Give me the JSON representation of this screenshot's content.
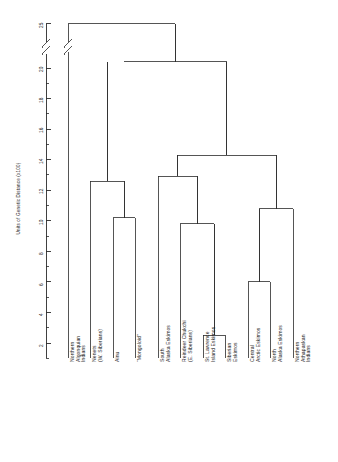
{
  "figure": {
    "title": "",
    "ylabel": "Units of Genetic Distance (x100)"
  },
  "axis": {
    "ticks": [
      {
        "value": 25,
        "label": "25"
      },
      {
        "value": 20,
        "label": "20"
      },
      {
        "value": 18,
        "label": "18"
      },
      {
        "value": 16,
        "label": "16"
      },
      {
        "value": 14,
        "label": "14"
      },
      {
        "value": 12,
        "label": "12"
      },
      {
        "value": 10,
        "label": "10"
      },
      {
        "value": 8,
        "label": "8"
      },
      {
        "value": 6,
        "label": "6"
      },
      {
        "value": 4,
        "label": "4"
      },
      {
        "value": 2,
        "label": "2"
      }
    ],
    "minor_ticks": [
      19,
      17,
      15,
      13,
      11,
      9,
      7,
      5,
      3,
      1
    ],
    "break_marker": true
  },
  "chart_data": {
    "type": "dendrogram",
    "title": "",
    "xlabel": "",
    "ylabel": "Units of Genetic Distance (x100)",
    "ylim": [
      0,
      25
    ],
    "grid": false,
    "legend": "none",
    "orientation": "top-down",
    "axis_break": {
      "from": 20.6,
      "to": 24.2
    },
    "leaves": [
      {
        "id": "northern-algonquian-indians",
        "line1": "Northern",
        "line2": "Algonquian",
        "line3": "Indians",
        "x": 68
      },
      {
        "id": "nenets-w-siberians",
        "line1": "Nenets",
        "line2": "(W. Siberians)",
        "line3": "",
        "x": 90
      },
      {
        "id": "ainu",
        "line1": "Ainu",
        "line2": "",
        "line3": "",
        "x": 113
      },
      {
        "id": "mongoloid",
        "line1": "“Mongoloid”",
        "line2": "",
        "line3": "",
        "x": 135
      },
      {
        "id": "south-alaska-eskimos",
        "line1": "South",
        "line2": "Alaska Eskimos",
        "line3": "",
        "x": 158
      },
      {
        "id": "reindeer-chukchi-e-siberians",
        "line1": "Reindeer Chukchi",
        "line2": "(E. Siberians)",
        "line3": "",
        "x": 180
      },
      {
        "id": "st-lawrence-island-eskimos",
        "line1": "St. Lawrence",
        "line2": "Island Eskimos",
        "line3": "",
        "x": 203
      },
      {
        "id": "siberian-eskimos",
        "line1": "Siberian",
        "line2": "Eskimos",
        "line3": "",
        "x": 225
      },
      {
        "id": "central-arctic-eskimos",
        "line1": "Central",
        "line2": "Arctic Eskimos",
        "line3": "",
        "x": 248
      },
      {
        "id": "north-alaska-eskimos",
        "line1": "North",
        "line2": "Alaska Eskimos",
        "line3": "",
        "x": 270
      },
      {
        "id": "northern-athapaskan-indians",
        "line1": "Northern",
        "line2": "Athapaskan",
        "line3": "Indians",
        "x": 293
      }
    ],
    "merges": [
      {
        "id": "m1",
        "name": "ainu-mongoloid",
        "height": 10.2,
        "left_x": 113,
        "right_x": 135
      },
      {
        "id": "m2",
        "name": "nenets-with-ainu-mongoloid",
        "height": 12.6,
        "left_x": 90,
        "right_x": 124
      },
      {
        "id": "m3",
        "name": "stlawrence-siberian-eskimos",
        "height": 2.5,
        "left_x": 203,
        "right_x": 225
      },
      {
        "id": "m4",
        "name": "reindeer-chukchi-with-eskimo-pair",
        "height": 9.8,
        "left_x": 180,
        "right_x": 214
      },
      {
        "id": "m5",
        "name": "south-alaska-with-chukchi-group",
        "height": 12.9,
        "left_x": 158,
        "right_x": 197
      },
      {
        "id": "m6",
        "name": "central-arctic-north-alaska",
        "height": 6.0,
        "left_x": 248,
        "right_x": 270
      },
      {
        "id": "m7",
        "name": "athapaskan-with-eskimo-pair",
        "height": 10.8,
        "left_x": 259,
        "right_x": 293
      },
      {
        "id": "m8",
        "name": "eskimo-superclade",
        "height": 14.3,
        "left_x": 177,
        "right_x": 276
      },
      {
        "id": "m9",
        "name": "asian-eskimo-join",
        "height": 20.4,
        "left_x": 124,
        "right_x": 227
      },
      {
        "id": "m10",
        "name": "root",
        "height": 25.0,
        "left_x": 68,
        "right_x": 175
      }
    ]
  },
  "colors": {
    "line": "#2b2b2b",
    "axis": "#2b2b2b",
    "background": "#ffffff",
    "text": "#1a1a1a"
  }
}
